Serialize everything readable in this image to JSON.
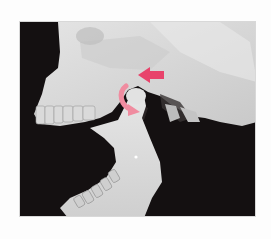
{
  "image": {
    "subject": "Lateral view of skull showing mandible displaced with condyle anterior to articular eminence",
    "alt_text": "Skull with dislocated jaw; pink arrows indicate backward push and downward rotation for reduction",
    "background_color": "#141011",
    "bone_color": "#d9d9d9",
    "arrow_color": "#e8436b",
    "arrow_light_color": "#f08ca0"
  },
  "annotations": [
    {
      "type": "straight-arrow",
      "direction": "left",
      "meaning": "posterior push"
    },
    {
      "type": "curved-arrow",
      "direction": "clockwise-down",
      "meaning": "downward rotation"
    }
  ]
}
